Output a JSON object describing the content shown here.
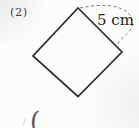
{
  "figure": {
    "problem_number": "(2)",
    "side_length_label": "5 cm",
    "answer_open_paren": "(",
    "shape": "rotated-square"
  },
  "geometry": {
    "square_points": "78,8 122,52 78,96.5 33,56",
    "dimension_arc_path": "M 80 8 C 98 4, 117 4, 127 12 C 133 17, 134.5 25, 129.5 31 C 124 37.5, 119 39.5, 118 44 C 117.4 47, 119.3 49, 122 51"
  },
  "colors": {
    "background": "#fcfcfa",
    "shape_line": "#2e2e2e",
    "dimension_dash": "#6e6e6e",
    "side_label_text": "#1f1f1f",
    "problem_number_text": "#3d3d3d"
  }
}
